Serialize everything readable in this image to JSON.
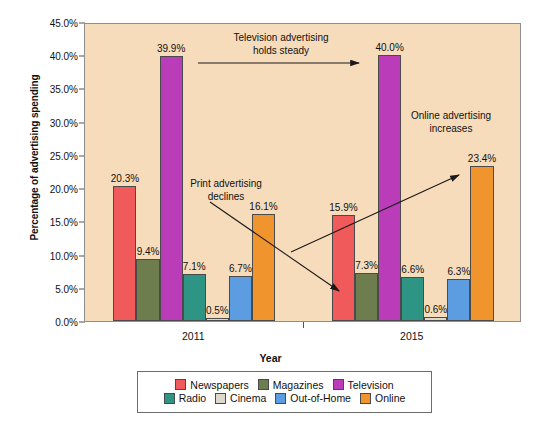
{
  "chart_data": {
    "type": "bar",
    "title": "",
    "xlabel": "Year",
    "ylabel": "Percentage of advertising spending",
    "categories": [
      "2011",
      "2015"
    ],
    "ylim": [
      0,
      45
    ],
    "ytick_step": 5,
    "ytick_labels": [
      "0.0%",
      "5.0%",
      "10.0%",
      "15.0%",
      "20.0%",
      "25.0%",
      "30.0%",
      "35.0%",
      "40.0%",
      "45.0%"
    ],
    "ytick_values": [
      0,
      5,
      10,
      15,
      20,
      25,
      30,
      35,
      40,
      45
    ],
    "grid": false,
    "legend_position": "bottom",
    "value_labels_shown": true,
    "series": [
      {
        "name": "Newspapers",
        "color": "#f05a5a",
        "values": [
          20.3,
          15.9
        ],
        "labels": [
          "20.3%",
          "15.9%"
        ]
      },
      {
        "name": "Magazines",
        "color": "#6e7d4e",
        "values": [
          9.4,
          7.3
        ],
        "labels": [
          "9.4%",
          "7.3%"
        ]
      },
      {
        "name": "Television",
        "color": "#bb3cb8",
        "values": [
          39.9,
          40.0
        ],
        "labels": [
          "39.9%",
          "40.0%"
        ]
      },
      {
        "name": "Radio",
        "color": "#2e9484",
        "values": [
          7.1,
          6.6
        ],
        "labels": [
          "7.1%",
          "6.6%"
        ]
      },
      {
        "name": "Cinema",
        "color": "#dedacb",
        "values": [
          0.5,
          0.6
        ],
        "labels": [
          "0.5%",
          "0.6%"
        ]
      },
      {
        "name": "Out-of-Home",
        "color": "#5b9de0",
        "values": [
          6.7,
          6.3
        ],
        "labels": [
          "6.7%",
          "6.3%"
        ]
      },
      {
        "name": "Online",
        "color": "#f0952e",
        "values": [
          16.1,
          23.4
        ],
        "labels": [
          "16.1%",
          "23.4%"
        ]
      }
    ],
    "annotations": [
      {
        "id": "television-steady",
        "text": "Television advertising\nholds steady"
      },
      {
        "id": "print-declines",
        "text": "Print advertising\ndeclines"
      },
      {
        "id": "online-increases",
        "text": "Online advertising\nincreases"
      }
    ],
    "plot_background": "#f7dcbc"
  },
  "legend": {
    "rows": [
      [
        {
          "label": "Newspapers",
          "color": "#f05a5a"
        },
        {
          "label": "Magazines",
          "color": "#6e7d4e"
        },
        {
          "label": "Television",
          "color": "#bb3cb8"
        }
      ],
      [
        {
          "label": "Radio",
          "color": "#2e9484"
        },
        {
          "label": "Cinema",
          "color": "#dedacb"
        },
        {
          "label": "Out-of-Home",
          "color": "#5b9de0"
        },
        {
          "label": "Online",
          "color": "#f0952e"
        }
      ]
    ]
  }
}
